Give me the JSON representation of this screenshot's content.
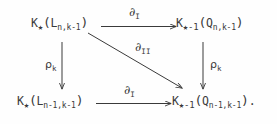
{
  "diagram": {
    "type": "commutative-diagram",
    "background_color": "#fefefe",
    "ink_color": "#3a3a3a",
    "nodes": {
      "top_left": {
        "full_text": "K_*(L_{n,k-1})",
        "head": "K",
        "head_sub": "★",
        "open_paren": "(",
        "body": "L",
        "body_sub": "n,k-1",
        "close_paren": ")"
      },
      "top_right": {
        "full_text": "K_{*-1}(Q_{n,k-1})",
        "head": "K",
        "head_sub": "★-1",
        "open_paren": "(",
        "body": "Q",
        "body_sub": "n,k-1",
        "close_paren": ")"
      },
      "bottom_left": {
        "full_text": "K_*(L_{n-1,k-1})",
        "head": "K",
        "head_sub": "★",
        "open_paren": "(",
        "body": "L",
        "body_sub": "n-1,k-1",
        "close_paren": ")"
      },
      "bottom_right": {
        "full_text": "K_{*-1}(Q_{n-1,k-1}).",
        "head": "K",
        "head_sub": "★-1",
        "open_paren": "(",
        "body": "Q",
        "body_sub": "n-1,k-1",
        "close_paren": ")",
        "trailing_punctuation": "."
      }
    },
    "arrows": {
      "top": {
        "label_symbol": "∂",
        "label_subscript": "I",
        "direction": "right",
        "from": "top_left",
        "to": "top_right"
      },
      "diagonal": {
        "label_symbol": "∂",
        "label_subscript": "II",
        "direction": "down-right",
        "from": "top_left",
        "to": "bottom_right"
      },
      "left_vertical": {
        "label_symbol": "ρ",
        "label_subscript": "k",
        "direction": "down",
        "from": "top_left",
        "to": "bottom_left"
      },
      "right_vertical": {
        "label_symbol": "ρ",
        "label_subscript": "k",
        "direction": "down",
        "from": "top_right",
        "to": "bottom_right"
      },
      "bottom": {
        "label_symbol": "∂",
        "label_subscript": "I",
        "direction": "right",
        "from": "bottom_left",
        "to": "bottom_right"
      }
    }
  }
}
